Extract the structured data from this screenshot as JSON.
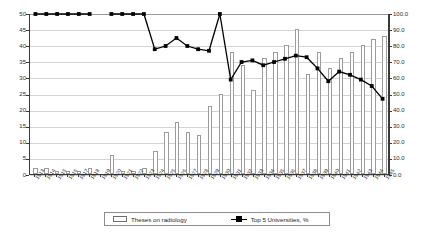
{
  "chart_data": {
    "type": "bar",
    "title": "",
    "subtitle": "",
    "xlabel": "",
    "ylabel": "",
    "y2label": "",
    "grid": true,
    "legend_position": "bottom",
    "ylim": [
      0,
      50
    ],
    "y2lim": [
      0,
      100
    ],
    "y_ticks": [
      "0",
      "5",
      "10",
      "15",
      "20",
      "25",
      "30",
      "35",
      "40",
      "45",
      "50"
    ],
    "y2_ticks": [
      "0.0",
      "10.0",
      "20.0",
      "30.0",
      "40.0",
      "50.0",
      "60.0",
      "70.0",
      "80.0",
      "90.0",
      "100.0"
    ],
    "categories": [
      "1913",
      "1914",
      "1915",
      "1916",
      "1917",
      "1918",
      "1919",
      "1920",
      "1921",
      "1922",
      "1923",
      "1924",
      "1925",
      "1926",
      "1927",
      "1928",
      "1929",
      "1930",
      "1931",
      "1932",
      "1933",
      "1934",
      "1935",
      "1936",
      "1937",
      "1938",
      "1939",
      "1940",
      "1941",
      "1942",
      "1943",
      "1944",
      "1945"
    ],
    "series": [
      {
        "name": "Theses on radiology",
        "type": "bar",
        "axis": "left",
        "values": [
          2,
          2,
          1,
          1,
          1,
          2,
          0,
          6,
          1,
          1,
          2,
          7,
          13,
          16,
          13,
          12,
          21,
          25,
          38,
          34,
          26,
          36,
          38,
          40,
          45,
          31,
          38,
          33,
          36,
          38,
          40,
          42,
          43
        ]
      },
      {
        "name": "Top 5 Universities, %",
        "type": "line",
        "axis": "right",
        "values": [
          100,
          100,
          100,
          100,
          100,
          100,
          null,
          100,
          100,
          100,
          100,
          78,
          80,
          85,
          80,
          78,
          77,
          100,
          59,
          70,
          71,
          68,
          70,
          72,
          74,
          73,
          66,
          58,
          64,
          62,
          59,
          55,
          47
        ]
      }
    ],
    "legend": [
      {
        "label": "Theses on radiology",
        "marker": "bar-swatch"
      },
      {
        "label": "Top 5 Universities, %",
        "marker": "line-marker"
      }
    ]
  },
  "colors": {
    "bar_fill": "#ffffff",
    "bar_stroke": "#9b9b9b",
    "line": "#000000",
    "grid": "#d3d3d3",
    "axis": "#3a3a3a",
    "background": "#ffffff",
    "text": "#2b2b2b"
  }
}
